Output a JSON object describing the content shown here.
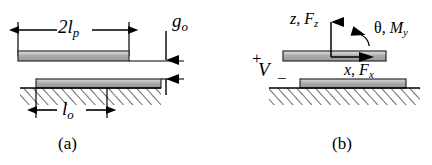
{
  "figure": {
    "panels": [
      {
        "id": "a",
        "caption": "(a)",
        "labels": {
          "plate_length": {
            "main": "2l",
            "sub": "p",
            "text": "2lp"
          },
          "gap": {
            "main": "g",
            "sub": "o",
            "text": "go"
          },
          "substrate_length": {
            "main": "l",
            "sub": "o",
            "text": "lo"
          }
        }
      },
      {
        "id": "b",
        "caption": "(b)",
        "labels": {
          "vertical_axis": {
            "main": "z, F",
            "sub": "z",
            "text": "z, Fz"
          },
          "rotation_axis": {
            "greek": "θ",
            "main": ", M",
            "sub": "y",
            "text": "θ, My"
          },
          "horizontal_axis": {
            "main": "x, F",
            "sub": "x",
            "text": "x, Fx"
          },
          "voltage": {
            "main": "V",
            "text": "V"
          },
          "plus": "+",
          "minus": "−"
        }
      }
    ],
    "colors": {
      "ink": "#000000",
      "bar_fill_light": "#d8d8d8",
      "bar_fill_mid": "#a9a9a9",
      "bar_fill_dark": "#8f8f8f",
      "background": "#ffffff"
    }
  }
}
